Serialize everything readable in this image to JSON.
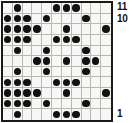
{
  "figure": {
    "type": "dot-matrix-grid",
    "columns": 11,
    "rows": 11,
    "dot_color": "#111111",
    "grid_line_color": "#b9b9b4",
    "border_color": "#1a1a1a",
    "background_color": "#f7f7f5"
  },
  "axis_labels": {
    "top": "11",
    "second": "10",
    "bottom": "1"
  },
  "chart_data": {
    "type": "heatmap",
    "title": "",
    "xlabel": "",
    "ylabel": "",
    "x": [
      1,
      2,
      3,
      4,
      5,
      6,
      7,
      8,
      9,
      10,
      11
    ],
    "categories": [
      "11",
      "10",
      "9",
      "8",
      "7",
      "6",
      "5",
      "4",
      "3",
      "2",
      "1"
    ],
    "grid": [
      [
        0,
        1,
        0,
        0,
        0,
        1,
        1,
        1,
        0,
        0,
        0
      ],
      [
        1,
        1,
        1,
        0,
        1,
        0,
        0,
        0,
        1,
        0,
        0
      ],
      [
        1,
        1,
        1,
        1,
        0,
        0,
        1,
        0,
        0,
        0,
        1
      ],
      [
        1,
        1,
        1,
        0,
        0,
        1,
        1,
        1,
        0,
        0,
        0
      ],
      [
        0,
        1,
        0,
        0,
        1,
        0,
        0,
        0,
        1,
        0,
        0
      ],
      [
        0,
        0,
        0,
        1,
        1,
        0,
        1,
        0,
        1,
        1,
        0
      ],
      [
        0,
        1,
        0,
        0,
        1,
        0,
        0,
        0,
        1,
        0,
        0
      ],
      [
        1,
        1,
        1,
        0,
        0,
        1,
        1,
        1,
        0,
        0,
        0
      ],
      [
        1,
        1,
        1,
        1,
        0,
        0,
        1,
        0,
        0,
        0,
        1
      ],
      [
        1,
        1,
        1,
        0,
        1,
        0,
        0,
        0,
        1,
        0,
        0
      ],
      [
        0,
        1,
        0,
        0,
        0,
        1,
        1,
        1,
        0,
        0,
        0
      ]
    ],
    "row_labels": [
      "11",
      "10",
      "9",
      "8",
      "7",
      "6",
      "5",
      "4",
      "3",
      "2",
      "1"
    ],
    "dots_per_row": [
      {
        "row": "11",
        "columns": [
          2,
          6,
          7,
          8
        ]
      },
      {
        "row": "10",
        "columns": [
          1,
          2,
          3,
          5,
          9
        ]
      },
      {
        "row": "9",
        "columns": [
          1,
          2,
          3,
          4,
          7,
          11
        ]
      },
      {
        "row": "8",
        "columns": [
          1,
          2,
          3,
          6,
          7,
          8
        ]
      },
      {
        "row": "7",
        "columns": [
          2,
          5,
          9
        ]
      },
      {
        "row": "6",
        "columns": [
          4,
          5,
          7,
          9,
          10
        ]
      },
      {
        "row": "5",
        "columns": [
          2,
          5,
          9
        ]
      },
      {
        "row": "4",
        "columns": [
          1,
          2,
          3,
          6,
          7,
          8
        ]
      },
      {
        "row": "3",
        "columns": [
          1,
          2,
          3,
          4,
          7,
          11
        ]
      },
      {
        "row": "2",
        "columns": [
          1,
          2,
          3,
          5,
          9
        ]
      },
      {
        "row": "1",
        "columns": [
          2,
          6,
          7,
          8
        ]
      }
    ],
    "total_dots": 53,
    "grid_on": true,
    "legend": []
  }
}
